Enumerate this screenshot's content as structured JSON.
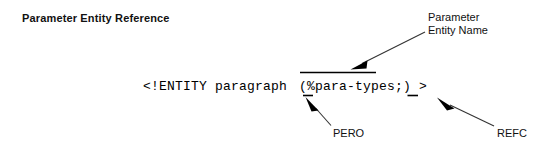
{
  "figure": {
    "title": "Parameter Entity Reference",
    "background_color": "#ffffff",
    "ink_color": "#000000"
  },
  "code": {
    "declaration": "<!ENTITY paragraph",
    "reference": "(%para-types;) >"
  },
  "annotations": {
    "entity_name": "Parameter\nEntity Name",
    "pero": "PERO",
    "refc": "REFC"
  }
}
